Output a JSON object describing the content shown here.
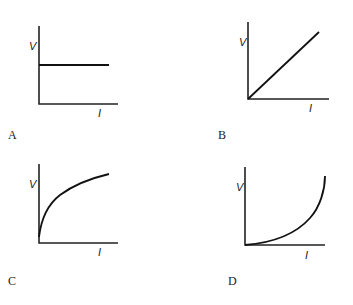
{
  "panels": [
    {
      "label": "A",
      "y_axis": "V",
      "x_axis": "I",
      "shape": "constant"
    },
    {
      "label": "B",
      "y_axis": "V",
      "x_axis": "I",
      "shape": "linear"
    },
    {
      "label": "C",
      "y_axis": "V",
      "x_axis": "I",
      "shape": "concave-down (square-root-like)"
    },
    {
      "label": "D",
      "y_axis": "V",
      "x_axis": "I",
      "shape": "concave-up (exponential-like)"
    }
  ]
}
